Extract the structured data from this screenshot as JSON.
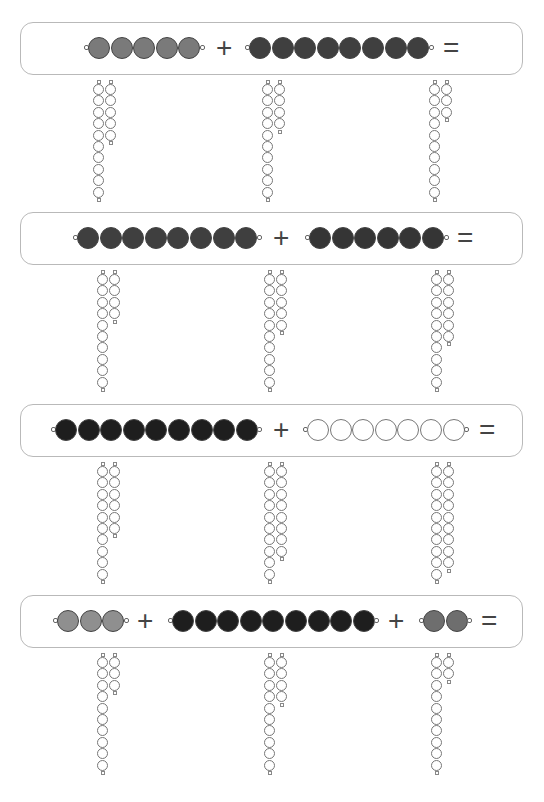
{
  "worksheet": {
    "title": "",
    "colors": {
      "light_gray": "#8f8f8f",
      "gray": "#7a7a7a",
      "mid_gray": "#6e6e6e",
      "dark_gray": "#3f3f3f",
      "darker": "#353535",
      "black": "#1e1e1e",
      "white": "#ffffff",
      "box_border": "#b9b9b9"
    },
    "problems": [
      {
        "id": 1,
        "top": 22,
        "terms": [
          {
            "count": 5,
            "color": "gray",
            "left": 88
          },
          {
            "count": 8,
            "color": "dark_gray",
            "left": 249
          }
        ],
        "operators": [
          {
            "symbol": "+",
            "left": 216
          },
          {
            "symbol": "=",
            "left": 443
          }
        ],
        "answer_options": [
          {
            "tens": 10,
            "units": 5,
            "left": 93
          },
          {
            "tens": 10,
            "units": 4,
            "left": 262
          },
          {
            "tens": 10,
            "units": 3,
            "left": 429
          }
        ]
      },
      {
        "id": 2,
        "top": 212,
        "terms": [
          {
            "count": 8,
            "color": "dark_gray",
            "left": 77
          },
          {
            "count": 6,
            "color": "darker",
            "left": 309
          }
        ],
        "operators": [
          {
            "symbol": "+",
            "left": 273
          },
          {
            "symbol": "=",
            "left": 457
          }
        ],
        "answer_options": [
          {
            "tens": 10,
            "units": 4,
            "left": 97
          },
          {
            "tens": 10,
            "units": 5,
            "left": 264
          },
          {
            "tens": 10,
            "units": 6,
            "left": 431
          }
        ]
      },
      {
        "id": 3,
        "top": 404,
        "terms": [
          {
            "count": 9,
            "color": "black",
            "left": 55
          },
          {
            "count": 7,
            "color": "white",
            "left": 307
          }
        ],
        "operators": [
          {
            "symbol": "+",
            "left": 273
          },
          {
            "symbol": "=",
            "left": 479
          }
        ],
        "answer_options": [
          {
            "tens": 10,
            "units": 6,
            "left": 97
          },
          {
            "tens": 10,
            "units": 8,
            "left": 264
          },
          {
            "tens": 10,
            "units": 9,
            "left": 431
          }
        ]
      },
      {
        "id": 4,
        "top": 595,
        "terms": [
          {
            "count": 3,
            "color": "light_gray",
            "left": 57
          },
          {
            "count": 9,
            "color": "black",
            "left": 172
          },
          {
            "count": 2,
            "color": "mid_gray",
            "left": 423
          }
        ],
        "operators": [
          {
            "symbol": "+",
            "left": 137
          },
          {
            "symbol": "+",
            "left": 388
          },
          {
            "symbol": "=",
            "left": 481
          }
        ],
        "answer_options": [
          {
            "tens": 10,
            "units": 3,
            "left": 97
          },
          {
            "tens": 10,
            "units": 4,
            "left": 264
          },
          {
            "tens": 10,
            "units": 2,
            "left": 431
          }
        ]
      }
    ]
  }
}
